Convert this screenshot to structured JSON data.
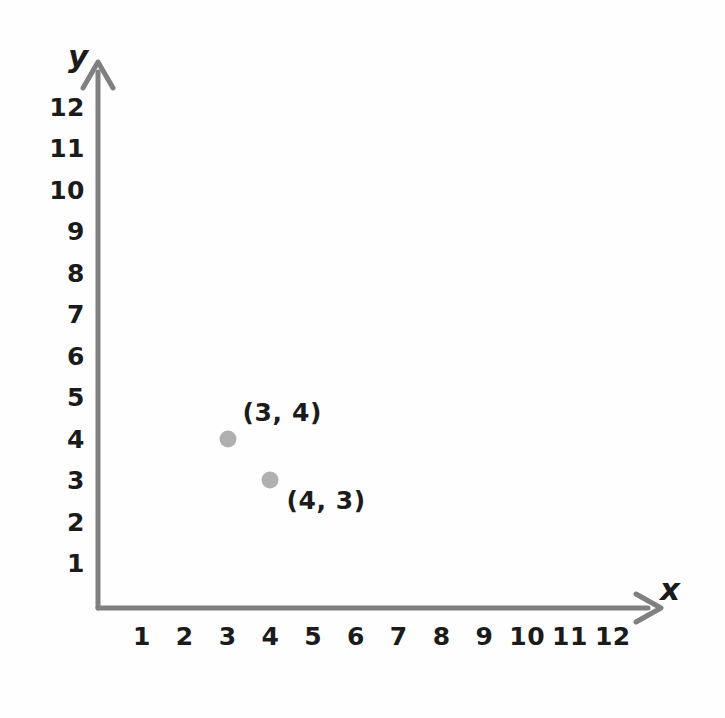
{
  "chart_data": {
    "type": "scatter",
    "title": "",
    "subtitle": "",
    "xlabel": "x",
    "ylabel": "y",
    "grid": false,
    "legend": false,
    "legend_position": "none",
    "xlim": [
      0,
      13
    ],
    "ylim": [
      0,
      13
    ],
    "xticks": [
      "1",
      "2",
      "3",
      "4",
      "5",
      "6",
      "7",
      "8",
      "9",
      "10",
      "11",
      "12"
    ],
    "yticks": [
      "1",
      "2",
      "3",
      "4",
      "5",
      "6",
      "7",
      "8",
      "9",
      "10",
      "11",
      "12"
    ],
    "x": [
      3,
      4
    ],
    "y": [
      4,
      3
    ],
    "points": [
      {
        "x": 3,
        "y": 4,
        "label": "(3, 4)",
        "label_position": "above-right"
      },
      {
        "x": 4,
        "y": 3,
        "label": "(4, 3)",
        "label_position": "below-right"
      }
    ],
    "annotations": [
      "(3, 4)",
      "(4, 3)"
    ],
    "series": [
      {
        "name": "points",
        "values": [
          {
            "x": 3,
            "y": 4
          },
          {
            "x": 4,
            "y": 3
          }
        ]
      }
    ]
  },
  "style": {
    "axis_color": "#808080",
    "text_color": "#1b1b1b",
    "point_color": "#b0b0b0",
    "background_color": "#fefefe"
  },
  "axes": {
    "x_axis_name": "x",
    "y_axis_name": "y",
    "x_arrow": "arrow-right",
    "y_arrow": "arrow-up"
  }
}
